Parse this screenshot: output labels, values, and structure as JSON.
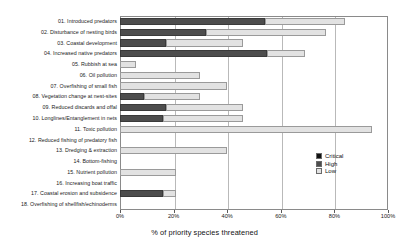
{
  "chart_data": {
    "type": "bar",
    "orientation": "horizontal",
    "stacked": true,
    "title": "",
    "xlabel": "% of priority species threatened",
    "ylabel": "",
    "xlim": [
      0,
      100
    ],
    "xticks": [
      "0%",
      "20%",
      "40%",
      "60%",
      "80%",
      "100%"
    ],
    "xtick_values": [
      0,
      20,
      40,
      60,
      80,
      100
    ],
    "grid": "vertical",
    "legend_position": "right-inside",
    "categories": [
      "01. Introduced predators",
      "02. Disturbance of nesting birds",
      "03. Coastal development",
      "04. Increased native predators",
      "05. Rubbish at sea",
      "06. Oil pollution",
      "07. Overfishing of small fish",
      "08. Vegetation change at nest-sites",
      "09. Reduced discards and offal",
      "10. Longlines/Entanglement in nets",
      "11. Toxic pollution",
      "12. Reduced fishing of predatory fish",
      "13. Dredging & extraction",
      "14. Bottom-fishing",
      "15. Nutrient pollution",
      "16. Increasing boat traffic",
      "17. Coastal erosion and subsidence",
      "18. Overfishing of shellfish/echinoderms"
    ],
    "series": [
      {
        "name": "Critical",
        "color": "#111111",
        "values": [
          0,
          0,
          0,
          0,
          0,
          0,
          0,
          0,
          0,
          0,
          0,
          0,
          0,
          0,
          0,
          0,
          0,
          0
        ]
      },
      {
        "name": "High",
        "color": "#4d4d4d",
        "values": [
          54,
          32,
          17,
          55,
          0,
          0,
          0,
          9,
          17,
          16,
          0,
          0,
          0,
          0,
          0,
          0,
          16,
          0
        ]
      },
      {
        "name": "Low",
        "color": "#e2e2e2",
        "values": [
          30,
          45,
          29,
          14,
          6,
          30,
          40,
          21,
          29,
          30,
          94,
          0,
          40,
          0,
          21,
          0,
          5,
          0
        ]
      }
    ],
    "totals": [
      84,
      77,
      46,
      69,
      6,
      30,
      40,
      30,
      46,
      46,
      94,
      0,
      40,
      0,
      21,
      0,
      21,
      0
    ]
  },
  "legend": {
    "items": [
      {
        "label": "Critical",
        "color": "#111111"
      },
      {
        "label": "High",
        "color": "#4d4d4d"
      },
      {
        "label": "Low",
        "color": "#e2e2e2"
      }
    ]
  }
}
